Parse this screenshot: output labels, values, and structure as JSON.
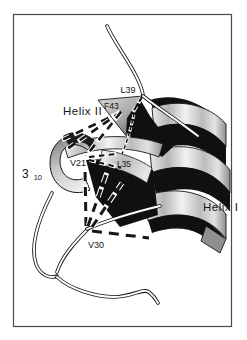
{
  "figure": {
    "kind": "protein-ribbon-structure-figure",
    "palette": {
      "paper": "#ffffff",
      "frame": "#4a4a4a",
      "ink": "#161616",
      "ribbon_shadow": "#101010",
      "ribbon_light_hi": "#f4f4f4",
      "ribbon_light_lo": "#9a9a9a",
      "cut_face": "#8f8f8f"
    }
  },
  "labels": {
    "helix_i": "Helix I",
    "helix_ii": "Helix II",
    "three_ten_base": "3",
    "three_ten_sub": "10",
    "residue_l39": "L39",
    "residue_f43": "F43",
    "residue_v21": "V21",
    "residue_l35": "L35",
    "residue_v30": "V30"
  }
}
